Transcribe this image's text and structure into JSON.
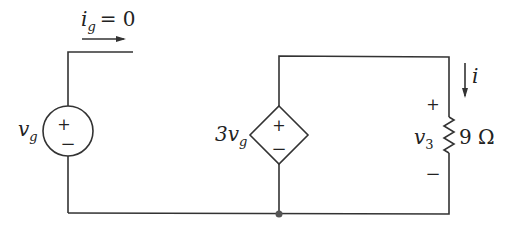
{
  "diagram": {
    "type": "circuit",
    "source_vg": {
      "label": "v",
      "sub": "g",
      "plus": "+",
      "minus": "−"
    },
    "current_ig": {
      "label": "i",
      "sub": "g",
      "value": "= 0"
    },
    "dependent_source": {
      "coef": "3v",
      "sub": "g",
      "plus": "+",
      "minus": "−"
    },
    "resistor": {
      "value": "9 Ω",
      "voltage_label": "v",
      "voltage_sub": "3",
      "plus": "+",
      "minus": "−"
    },
    "current_i": {
      "label": "i"
    }
  }
}
